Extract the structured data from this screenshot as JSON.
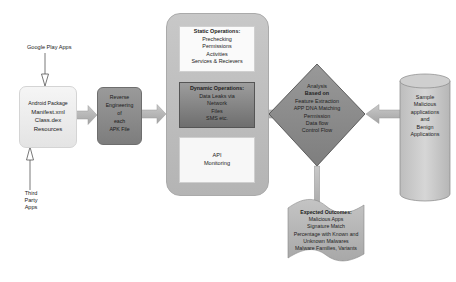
{
  "diagram": {
    "inputs": {
      "top_label": "Google Play Apps",
      "bottom_label": [
        "Third",
        "Party",
        "Apps"
      ]
    },
    "package_box": {
      "lines": [
        "Android Package",
        "Manifest.xml",
        "Class.dex",
        "Resources"
      ]
    },
    "reverse_box": {
      "lines": [
        "Reverse",
        "Engineering",
        "of",
        "each",
        "APK File"
      ]
    },
    "operations": {
      "static": {
        "title": "Static Operations:",
        "lines": [
          "Prechecking",
          "Permissions",
          "Activities",
          "Services & Recievers"
        ]
      },
      "dynamic": {
        "title": "Dynamic Operations:",
        "lines": [
          "Data Leaks via",
          "Network",
          "Files",
          "SMS etc."
        ]
      },
      "api": {
        "lines": [
          "API",
          "Monitoring"
        ]
      }
    },
    "analysis": {
      "title": [
        "Analysis",
        "Based on"
      ],
      "lines": [
        "Feature Extraction",
        "APP DNA  Matching",
        "Permission",
        "Data flow",
        "Control Flow"
      ]
    },
    "samples": {
      "lines": [
        "Sample",
        "Malicious",
        "applications",
        "and",
        "Benign",
        "Applications"
      ]
    },
    "outcomes": {
      "title": "Expected Outcomes:",
      "lines": [
        "Malicious Apps",
        "Signature Match",
        "Percentage with Known and",
        "Unknown Malwares",
        "Malware Families, Variants"
      ]
    },
    "colors": {
      "light_box": "#ececec",
      "mid_gray": "#8a8a8a",
      "container_gray": "#bdbdbd",
      "diamond_gray": "#8c8c8c",
      "arrow_gray": "#b5b5b5"
    }
  }
}
